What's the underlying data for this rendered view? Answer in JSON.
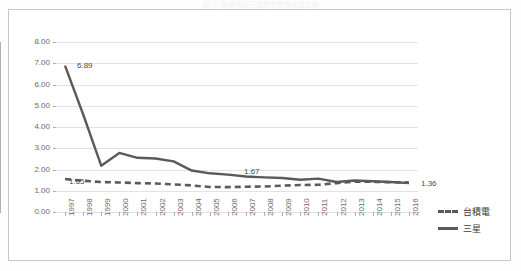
{
  "figure": {
    "title_faint": "圖 三 台積電與三星歷年營收成長比較",
    "frame_border_color": "#c8c8c8"
  },
  "legend": {
    "position": "right",
    "items": [
      {
        "label": "台積電",
        "style": "dashed",
        "color": "#5a5a5a"
      },
      {
        "label": "三星",
        "style": "solid",
        "color": "#5a5a5a"
      }
    ]
  },
  "chart_data": {
    "type": "line",
    "title": "圖 三 台積電與三星歷年營收成長比較",
    "xlabel": "",
    "ylabel": "",
    "ylim": [
      0,
      8
    ],
    "ytick_labels": [
      "0.00",
      "1.00",
      "2.00",
      "3.00",
      "4.00",
      "5.00",
      "6.00",
      "7.00",
      "8.00"
    ],
    "ytick_values": [
      0,
      1,
      2,
      3,
      4,
      5,
      6,
      7,
      8
    ],
    "grid": true,
    "legend_position": "right",
    "categories": [
      "1997",
      "1998",
      "1999",
      "2000",
      "2001",
      "2002",
      "2003",
      "2004",
      "2005",
      "2006",
      "2007",
      "2008",
      "2009",
      "2010",
      "2011",
      "2012",
      "2013",
      "2014",
      "2015",
      "2016"
    ],
    "series": [
      {
        "name": "台積電",
        "style": "dashed",
        "color": "#5a5a5a",
        "values": [
          1.55,
          1.47,
          1.41,
          1.39,
          1.36,
          1.34,
          1.3,
          1.25,
          1.18,
          1.17,
          1.19,
          1.2,
          1.24,
          1.27,
          1.28,
          1.36,
          1.43,
          1.42,
          1.4,
          1.39
        ]
      },
      {
        "name": "三星",
        "style": "solid",
        "color": "#5a5a5a",
        "values": [
          6.89,
          4.6,
          2.18,
          2.78,
          2.55,
          2.52,
          2.38,
          1.95,
          1.82,
          1.76,
          1.67,
          1.63,
          1.6,
          1.52,
          1.57,
          1.41,
          1.48,
          1.45,
          1.41,
          1.36
        ]
      }
    ],
    "annotations": [
      {
        "text": "6.89",
        "series": "三星",
        "category": "1997",
        "value": 6.89
      },
      {
        "text": "1.65",
        "series": "台積電",
        "category": "1997",
        "value": 1.55
      },
      {
        "text": "1.67",
        "series": "三星",
        "category": "2007",
        "value": 1.67
      },
      {
        "text": "1.36",
        "series": "三星",
        "category": "2016",
        "value": 1.36
      }
    ]
  }
}
